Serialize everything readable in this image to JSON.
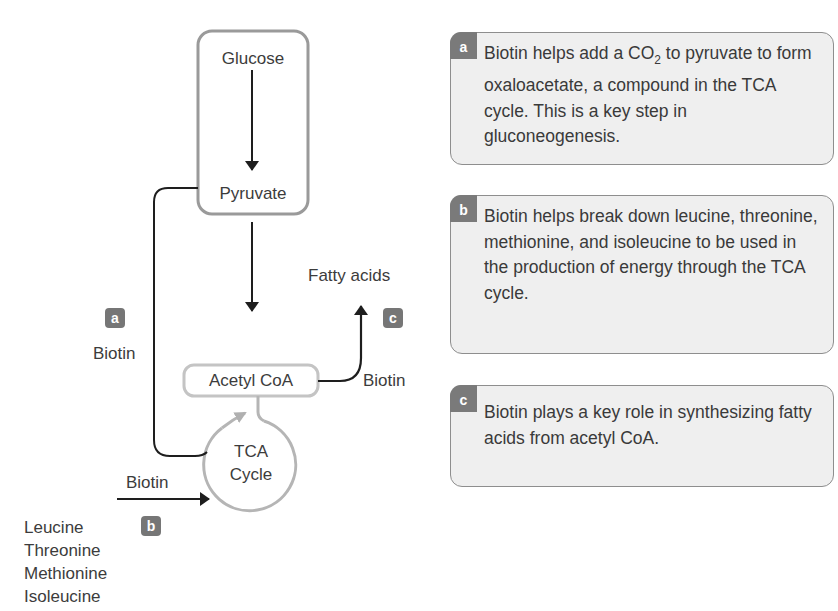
{
  "diagram": {
    "nodes": {
      "glucose": "Glucose",
      "pyruvate": "Pyruvate",
      "acetyl_coa": "Acetyl CoA",
      "tca_line1": "TCA",
      "tca_line2": "Cycle",
      "fatty_acids": "Fatty acids"
    },
    "labels": {
      "biotin_a": "Biotin",
      "biotin_b": "Biotin",
      "biotin_c": "Biotin"
    },
    "badges": {
      "a": "a",
      "b": "b",
      "c": "c"
    },
    "amino_acids": [
      "Leucine",
      "Threonine",
      "Methionine",
      "Isoleucine"
    ]
  },
  "panels": [
    {
      "tag": "a",
      "text_pre": "Biotin helps add a CO",
      "subscript": "2",
      "text_post": " to pyruvate to form oxaloacetate, a compound in the TCA cycle. This is a key step in gluconeogenesis."
    },
    {
      "tag": "b",
      "text": "Biotin helps break down leucine, threonine, methionine, and isoleucine to be used in the production of energy through the TCA cycle."
    },
    {
      "tag": "c",
      "text": "Biotin plays a key role in synthesizing fatty acids from acetyl CoA."
    }
  ],
  "colors": {
    "dark_line": "#1e1e1e",
    "grey_outline": "#9a9a9a",
    "light_grey_outline": "#bdbdbd",
    "badge": "#767676",
    "panel_bg": "#efefef"
  }
}
